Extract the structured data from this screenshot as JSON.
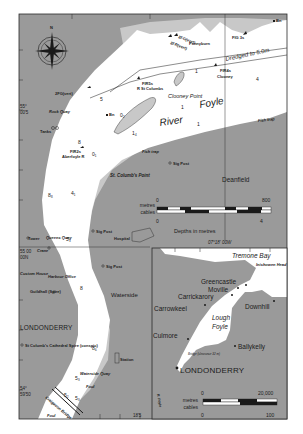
{
  "colors": {
    "land": "#9a9a9a",
    "water": "#ffffff",
    "drying": "#c8c8c8",
    "ink": "#1a1a1a",
    "border": "#2a2a2a",
    "page": "#ffffff"
  },
  "main_map": {
    "place_names": {
      "river": "River",
      "foyle": "Foyle",
      "clooney_point": "Clooney Point",
      "st_columbs_point": "St. Columb's Point",
      "deanfield": "Deanfield",
      "waterside": "Waterside",
      "londonderry": "LONDONDERRY",
      "rock_quay": "Rock Quay",
      "pennyburn": "Pennyburn",
      "queens_quay": "Queens Quay",
      "waterside_quay": "Waterside Quay",
      "craigavon_bridge": "Craigavon Bridge",
      "hospital": "Hospital",
      "station": "Station",
      "custom_house": "Custom House",
      "harbour_office": "Harbour Office",
      "guildhall": "Guildhall (Spire)",
      "st_columbs_cathedral": "St Columb's Cathedral Spire (conspic)",
      "tanks": "Tanks",
      "tower": "Tower",
      "crane": "Crane"
    },
    "annotations": {
      "dredged": "Dredged to 5.0m",
      "fish_trap_1": "Fish trap",
      "fish_trap_2": "Fish trap",
      "sig_post_1": "Sig Post",
      "sig_post_2": "Sig Post",
      "sig_post_3": "Sig Post",
      "foul_1": "Foul",
      "foul_2": "Foul"
    },
    "lights": {
      "l1": "2FG(vert)",
      "l2": "2FG(vert)",
      "l3": "2FR(vert)",
      "l4": "FIG 3s",
      "l5": "FIR4s",
      "l6": "Clooney",
      "l7": "FIR5s",
      "l8": "R St Columbs",
      "l9": "FIR2s",
      "l10": "Aberfoyle R",
      "bn1": "Bn",
      "bn2": "Bn"
    },
    "soundings": {
      "s1": "5",
      "s2": "1",
      "s3": "1",
      "s4": "1",
      "s5": "4",
      "s6": "8",
      "s7": "0₁",
      "s8": "8₈",
      "s9": "4₁",
      "s10": "5₃",
      "s11": "8",
      "s12": "8₆",
      "s13": "5₃",
      "s14": "5₂",
      "s15": "5₃",
      "s16": "1₄",
      "s17": "0₂"
    },
    "coordinates": {
      "lat_1_deg": "55°",
      "lat_1_min": "00'5",
      "lat_2": "55 00",
      "lat_2b": "00N",
      "lat_3_deg": "54°",
      "lat_3_min": "59'50",
      "lon_1": "07°18' 00W",
      "lon_2": "18'5"
    },
    "scale_bar": {
      "top_label": "metres",
      "bottom_label": "cables",
      "top_start": "0",
      "top_end": "800",
      "bottom_start": "0",
      "bottom_end": "4",
      "depths_note": "Depths in metres"
    },
    "compass": {
      "north_label": "N"
    }
  },
  "inset_map": {
    "place_names": {
      "tremone_bay": "Tremone Bay",
      "inishowen_head": "Inishowen Head",
      "greencastle": "Greencastle",
      "moville": "Moville",
      "carrickarory": "Carrickarory",
      "carrowkeel": "Carrowkeel",
      "downhill": "Downhill",
      "lough": "Lough",
      "foyle": "Foyle",
      "culmore": "Culmore",
      "ballykelly": "Ballykelly",
      "londonderry": "LONDONDERRY",
      "r_foyle": "R. Foyle",
      "bridge": "Bridge (clearance 32 m)"
    },
    "scale_bar": {
      "top_label": "metres",
      "bottom_label": "cables",
      "top_start": "0",
      "top_end": "20,000",
      "bottom_start": "0",
      "bottom_end": "100"
    }
  }
}
